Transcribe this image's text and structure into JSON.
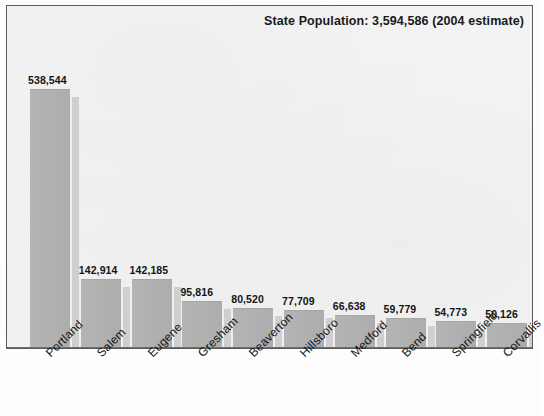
{
  "chart_data": {
    "type": "bar",
    "title": "State Population: 3,594,586 (2004 estimate)",
    "xlabel": "",
    "ylabel": "",
    "ylim": [
      0,
      560000
    ],
    "grid": false,
    "legend": null,
    "categories": [
      "Portland",
      "Salem",
      "Eugene",
      "Gresham",
      "Beaverton",
      "Hillsboro",
      "Medford",
      "Bend",
      "Springfield",
      "Corvallis"
    ],
    "values": [
      538544,
      142914,
      142185,
      95816,
      80520,
      77709,
      66638,
      59779,
      54773,
      50126
    ],
    "value_labels": [
      "538,544",
      "142,914",
      "142,185",
      "95,816",
      "80,520",
      "77,709",
      "66,638",
      "59,779",
      "54,773",
      "50,126"
    ],
    "annotations": [
      "State Population: 3,594,586 (2004 estimate)"
    ],
    "colors": {
      "bar_fill": "#b0b0b0",
      "bar_shadow": "#cfcfcf",
      "plot_background": "#f3f3f3",
      "frame_border": "#5a5a5a",
      "text": "#141414"
    }
  }
}
